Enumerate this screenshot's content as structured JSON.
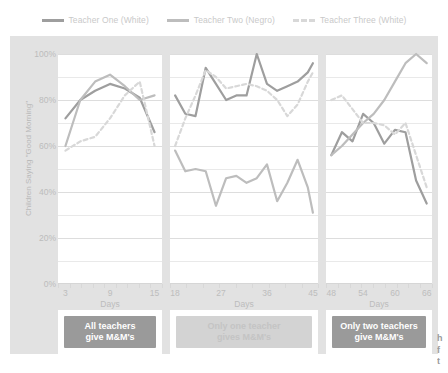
{
  "legend": {
    "items": [
      {
        "label": "Teacher One (White)",
        "color": "#9e9e9e",
        "style": "solid",
        "icon": "line-swatch-icon"
      },
      {
        "label": "Teacher Two (Negro)",
        "color": "#bdbdbd",
        "style": "solid",
        "icon": "line-swatch-icon"
      },
      {
        "label": "Teacher Three (White)",
        "color": "#d8d8d8",
        "style": "dashed",
        "icon": "dashed-line-swatch-icon"
      }
    ]
  },
  "colors": {
    "plate": "#e2e2e2",
    "panel": "#ffffff",
    "grid": "#e9e9e9",
    "teacher_one": "#9e9e9e",
    "teacher_two": "#bdbdbd",
    "teacher_three": "#d8d8d8",
    "caption_strong": "#9a9a9a",
    "caption_faded": "#d3d3d3",
    "caption_text": "#ffffff",
    "tick_text": "#bcbcbc"
  },
  "panels": [
    {
      "id": "panel-1",
      "caption": "All teachers\ngive M&M's",
      "caption_line1": "All teachers",
      "caption_line2": "give M&M's",
      "caption_faded": false,
      "xlabel": "Days",
      "xticks": [
        3,
        9,
        15
      ],
      "xrange": [
        2,
        16
      ]
    },
    {
      "id": "panel-2",
      "caption": "Only one teacher\ngives M&M's",
      "caption_line1": "Only one teacher",
      "caption_line2": "gives M&M's",
      "caption_faded": true,
      "xlabel": "Days",
      "xticks": [
        18,
        27,
        36,
        45
      ],
      "xrange": [
        17,
        46
      ]
    },
    {
      "id": "panel-3",
      "caption": "Only two teachers\ngive M&M's",
      "caption_line1": "Only two teachers",
      "caption_line2": "give M&M's",
      "caption_faded": false,
      "xlabel": "Days",
      "xticks": [
        48,
        54,
        60,
        66
      ],
      "xrange": [
        47,
        67
      ]
    }
  ],
  "edge_fragment": "h\nf\nt",
  "chart_data": {
    "type": "line",
    "title": "",
    "xlabel": "Days",
    "ylabel": "Children Saying \"Good Morning\"",
    "ylim": [
      0,
      100
    ],
    "yticks": [
      0,
      20,
      40,
      60,
      80,
      100
    ],
    "ytick_labels": [
      "0%",
      "20%",
      "40%",
      "60%",
      "80%",
      "100%"
    ],
    "gridlines_every": 10,
    "legend_position": "top-center",
    "note": "Multiple-baseline design across three panels; x is Days, y is percent of children saying Good Morning.",
    "series": [
      {
        "name": "Teacher One (White)",
        "color": "#9e9e9e",
        "style": "solid",
        "panels": [
          {
            "panel": "panel-1",
            "x": [
              3,
              5,
              7,
              9,
              11,
              13,
              15
            ],
            "y": [
              72,
              80,
              84,
              87,
              85,
              81,
              66
            ]
          },
          {
            "panel": "panel-2",
            "x": [
              18,
              20,
              22,
              24,
              26,
              28,
              30,
              32,
              34,
              36,
              38,
              40,
              42,
              44,
              45
            ],
            "y": [
              82,
              74,
              73,
              94,
              87,
              80,
              82,
              82,
              100,
              87,
              84,
              86,
              88,
              92,
              96
            ]
          },
          {
            "panel": "panel-3",
            "x": [
              48,
              50,
              52,
              54,
              56,
              58,
              60,
              62,
              64,
              66
            ],
            "y": [
              56,
              66,
              62,
              74,
              70,
              61,
              67,
              66,
              45,
              35
            ]
          }
        ]
      },
      {
        "name": "Teacher Two (Negro)",
        "color": "#bdbdbd",
        "style": "solid",
        "panels": [
          {
            "panel": "panel-1",
            "x": [
              3,
              5,
              7,
              9,
              11,
              13,
              15
            ],
            "y": [
              60,
              80,
              88,
              91,
              86,
              80,
              82
            ]
          },
          {
            "panel": "panel-2",
            "x": [
              18,
              20,
              22,
              24,
              26,
              28,
              30,
              32,
              34,
              36,
              38,
              40,
              42,
              44,
              45
            ],
            "y": [
              58,
              49,
              50,
              49,
              34,
              46,
              47,
              44,
              46,
              52,
              36,
              44,
              54,
              42,
              31
            ]
          },
          {
            "panel": "panel-3",
            "x": [
              48,
              50,
              52,
              54,
              56,
              58,
              60,
              62,
              64,
              66
            ],
            "y": [
              56,
              60,
              65,
              70,
              74,
              80,
              88,
              96,
              100,
              96
            ]
          }
        ]
      },
      {
        "name": "Teacher Three (White)",
        "color": "#d8d8d8",
        "style": "dashed",
        "panels": [
          {
            "panel": "panel-1",
            "x": [
              3,
              5,
              7,
              9,
              11,
              13,
              15
            ],
            "y": [
              58,
              62,
              64,
              72,
              82,
              88,
              60
            ]
          },
          {
            "panel": "panel-2",
            "x": [
              18,
              20,
              22,
              24,
              26,
              28,
              30,
              32,
              34,
              36,
              38,
              40,
              42,
              44,
              45
            ],
            "y": [
              60,
              72,
              82,
              93,
              90,
              85,
              86,
              87,
              86,
              84,
              80,
              73,
              78,
              88,
              92
            ]
          },
          {
            "panel": "panel-3",
            "x": [
              48,
              50,
              52,
              54,
              56,
              58,
              60,
              62,
              64,
              66
            ],
            "y": [
              80,
              82,
              76,
              70,
              70,
              69,
              65,
              70,
              56,
              42
            ]
          }
        ]
      }
    ]
  }
}
